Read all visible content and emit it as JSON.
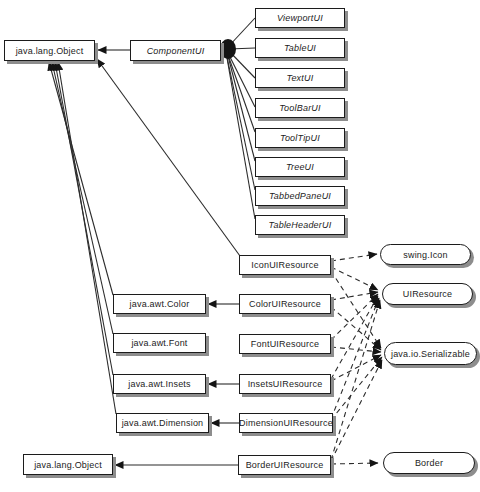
{
  "diagram": {
    "colors": {
      "background": "#ffffff",
      "node_fill": "#ffffff",
      "node_border": "#1c1c1c",
      "node_shadow": "#8d8d8d",
      "line": "#2b2b2b",
      "text": "#1c1c1c"
    },
    "nodes": [
      {
        "id": "object-top",
        "label": "java.lang.Object",
        "shape": "box",
        "italic": false
      },
      {
        "id": "componentui",
        "label": "ComponentUI",
        "shape": "box",
        "italic": true
      },
      {
        "id": "viewportui",
        "label": "ViewportUI",
        "shape": "box",
        "italic": true
      },
      {
        "id": "tableui",
        "label": "TableUI",
        "shape": "box",
        "italic": true
      },
      {
        "id": "textui",
        "label": "TextUI",
        "shape": "box",
        "italic": true
      },
      {
        "id": "toolbarui",
        "label": "ToolBarUI",
        "shape": "box",
        "italic": true
      },
      {
        "id": "tooltipui",
        "label": "ToolTipUI",
        "shape": "box",
        "italic": true
      },
      {
        "id": "treeui",
        "label": "TreeUI",
        "shape": "box",
        "italic": true
      },
      {
        "id": "tabbedpaneui",
        "label": "TabbedPaneUI",
        "shape": "box",
        "italic": true
      },
      {
        "id": "tableheaderui",
        "label": "TableHeaderUI",
        "shape": "box",
        "italic": true
      },
      {
        "id": "iconuiresource",
        "label": "IconUIResource",
        "shape": "box",
        "italic": false
      },
      {
        "id": "coloruiresource",
        "label": "ColorUIResource",
        "shape": "box",
        "italic": false
      },
      {
        "id": "fontuiresource",
        "label": "FontUIResource",
        "shape": "box",
        "italic": false
      },
      {
        "id": "insetsuiresource",
        "label": "InsetsUIResource",
        "shape": "box",
        "italic": false
      },
      {
        "id": "dimensionuiresource",
        "label": "DimensionUIResource",
        "shape": "box",
        "italic": false
      },
      {
        "id": "borderuiresource",
        "label": "BorderUIResource",
        "shape": "box",
        "italic": false
      },
      {
        "id": "awt-color",
        "label": "java.awt.Color",
        "shape": "box",
        "italic": false
      },
      {
        "id": "awt-font",
        "label": "java.awt.Font",
        "shape": "box",
        "italic": false
      },
      {
        "id": "awt-insets",
        "label": "java.awt.Insets",
        "shape": "box",
        "italic": false
      },
      {
        "id": "awt-dimension",
        "label": "java.awt.Dimension",
        "shape": "box",
        "italic": false
      },
      {
        "id": "object-bottom",
        "label": "java.lang.Object",
        "shape": "box",
        "italic": false
      },
      {
        "id": "swing-icon",
        "label": "swing.Icon",
        "shape": "oval",
        "italic": false
      },
      {
        "id": "uiresource",
        "label": "UIResource",
        "shape": "oval",
        "italic": false
      },
      {
        "id": "serializable",
        "label": "java.io.Serializable",
        "shape": "oval",
        "italic": false
      },
      {
        "id": "border",
        "label": "Border",
        "shape": "oval",
        "italic": false
      }
    ],
    "edges": [
      {
        "from": "componentui",
        "to": "object-top",
        "style": "solid",
        "arrow": true
      },
      {
        "from": "viewportui",
        "to": "componentui",
        "style": "solid",
        "arrow": false
      },
      {
        "from": "tableui",
        "to": "componentui",
        "style": "solid",
        "arrow": false
      },
      {
        "from": "textui",
        "to": "componentui",
        "style": "solid",
        "arrow": false
      },
      {
        "from": "toolbarui",
        "to": "componentui",
        "style": "solid",
        "arrow": false
      },
      {
        "from": "tooltipui",
        "to": "componentui",
        "style": "solid",
        "arrow": false
      },
      {
        "from": "treeui",
        "to": "componentui",
        "style": "solid",
        "arrow": false
      },
      {
        "from": "tabbedpaneui",
        "to": "componentui",
        "style": "solid",
        "arrow": false
      },
      {
        "from": "tableheaderui",
        "to": "componentui",
        "style": "solid",
        "arrow": false
      },
      {
        "from": "iconuiresource",
        "to": "object-top",
        "style": "solid",
        "arrow": true
      },
      {
        "from": "awt-color",
        "to": "object-top",
        "style": "solid",
        "arrow": true
      },
      {
        "from": "awt-font",
        "to": "object-top",
        "style": "solid",
        "arrow": true
      },
      {
        "from": "awt-insets",
        "to": "object-top",
        "style": "solid",
        "arrow": true
      },
      {
        "from": "awt-dimension",
        "to": "object-top",
        "style": "solid",
        "arrow": true
      },
      {
        "from": "coloruiresource",
        "to": "awt-color",
        "style": "solid",
        "arrow": true
      },
      {
        "from": "insetsuiresource",
        "to": "awt-insets",
        "style": "solid",
        "arrow": true
      },
      {
        "from": "dimensionuiresource",
        "to": "awt-dimension",
        "style": "solid",
        "arrow": true
      },
      {
        "from": "borderuiresource",
        "to": "object-bottom",
        "style": "solid",
        "arrow": true
      },
      {
        "from": "iconuiresource",
        "to": "swing-icon",
        "style": "dashed",
        "arrow": true
      },
      {
        "from": "iconuiresource",
        "to": "uiresource",
        "style": "dashed",
        "arrow": true
      },
      {
        "from": "iconuiresource",
        "to": "serializable",
        "style": "dashed",
        "arrow": true
      },
      {
        "from": "coloruiresource",
        "to": "uiresource",
        "style": "dashed",
        "arrow": true
      },
      {
        "from": "coloruiresource",
        "to": "serializable",
        "style": "dashed",
        "arrow": true
      },
      {
        "from": "fontuiresource",
        "to": "uiresource",
        "style": "dashed",
        "arrow": true
      },
      {
        "from": "fontuiresource",
        "to": "serializable",
        "style": "dashed",
        "arrow": true
      },
      {
        "from": "insetsuiresource",
        "to": "uiresource",
        "style": "dashed",
        "arrow": true
      },
      {
        "from": "insetsuiresource",
        "to": "serializable",
        "style": "dashed",
        "arrow": true
      },
      {
        "from": "dimensionuiresource",
        "to": "uiresource",
        "style": "dashed",
        "arrow": true
      },
      {
        "from": "dimensionuiresource",
        "to": "serializable",
        "style": "dashed",
        "arrow": true
      },
      {
        "from": "borderuiresource",
        "to": "uiresource",
        "style": "dashed",
        "arrow": true
      },
      {
        "from": "borderuiresource",
        "to": "serializable",
        "style": "dashed",
        "arrow": true
      },
      {
        "from": "borderuiresource",
        "to": "border",
        "style": "dashed",
        "arrow": true
      }
    ]
  }
}
